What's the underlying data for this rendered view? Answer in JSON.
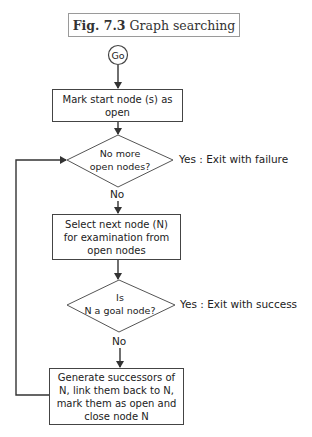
{
  "figure": {
    "label": "Fig. 7.3",
    "title": "Graph searching"
  },
  "start": {
    "label": "Go"
  },
  "steps": [
    {
      "id": "mark-start",
      "text": "Mark start node (s) as open",
      "lines": [
        "Mark start node (s) as",
        "open"
      ]
    },
    {
      "id": "select-next",
      "text": "Select next node (N) for examination from open nodes",
      "lines": [
        "Select next node (N)",
        "for examination from",
        "open nodes"
      ]
    },
    {
      "id": "generate",
      "text": "Generate successors of N, link them back to N, mark them as open and close node N",
      "lines": [
        "Generate successors of",
        "N, link them back to N,",
        "mark them as open and",
        "close node N"
      ]
    }
  ],
  "decisions": [
    {
      "id": "no-more-open",
      "lines": [
        "No more",
        "open nodes?"
      ],
      "yes_label": "Yes : Exit with failure",
      "no_label": "No"
    },
    {
      "id": "is-goal",
      "lines": [
        "Is",
        "N a goal node?"
      ],
      "yes_label": "Yes : Exit with success",
      "no_label": "No"
    }
  ],
  "colors": {
    "stroke": "#444444",
    "text": "#222222",
    "title_border": "#9a9a9a"
  }
}
